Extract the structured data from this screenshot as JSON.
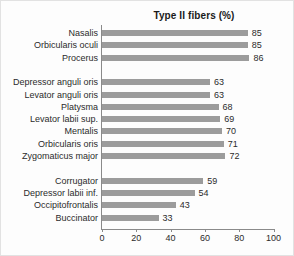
{
  "chart_data": {
    "type": "bar",
    "orientation": "horizontal",
    "title": "Type II fibers (%)",
    "xlabel": "",
    "ylabel": "",
    "xlim": [
      0,
      100
    ],
    "xticks": [
      0,
      20,
      40,
      60,
      80,
      100
    ],
    "grid": false,
    "legend": null,
    "bar_color": "#9c9c9c",
    "axis_color": "#8a8a8a",
    "text_color": "#2b2b2b",
    "categories": [
      "Nasalis",
      "Orbicularis oculi",
      "Procerus",
      "Depressor anguli oris",
      "Levator anguli oris",
      "Platysma",
      "Levator labii sup.",
      "Mentalis",
      "Orbicularis oris",
      "Zygomaticus major",
      "Corrugator",
      "Depressor labii inf.",
      "Occipitofrontalis",
      "Buccinator"
    ],
    "values": [
      85,
      85,
      86,
      63,
      63,
      68,
      69,
      70,
      71,
      72,
      59,
      54,
      43,
      33
    ],
    "groups": [
      {
        "name": "group-1",
        "categories": [
          "Nasalis",
          "Orbicularis oculi",
          "Procerus"
        ],
        "values": [
          85,
          85,
          86
        ]
      },
      {
        "name": "group-2",
        "categories": [
          "Depressor anguli oris",
          "Levator anguli oris",
          "Platysma",
          "Levator labii sup.",
          "Mentalis",
          "Orbicularis oris",
          "Zygomaticus major"
        ],
        "values": [
          63,
          63,
          68,
          69,
          70,
          71,
          72
        ]
      },
      {
        "name": "group-3",
        "categories": [
          "Corrugator",
          "Depressor labii inf.",
          "Occipitofrontalis",
          "Buccinator"
        ],
        "values": [
          59,
          54,
          43,
          33
        ]
      }
    ],
    "rows": [
      {
        "label": "Nasalis",
        "value": 85,
        "slot": 0
      },
      {
        "label": "Orbicularis oculi",
        "value": 85,
        "slot": 1
      },
      {
        "label": "Procerus",
        "value": 86,
        "slot": 2
      },
      {
        "label": "Depressor anguli oris",
        "value": 63,
        "slot": 4
      },
      {
        "label": "Levator anguli oris",
        "value": 63,
        "slot": 5
      },
      {
        "label": "Platysma",
        "value": 68,
        "slot": 6
      },
      {
        "label": "Levator labii sup.",
        "value": 69,
        "slot": 7
      },
      {
        "label": "Mentalis",
        "value": 70,
        "slot": 8
      },
      {
        "label": "Orbicularis oris",
        "value": 71,
        "slot": 9
      },
      {
        "label": "Zygomaticus major",
        "value": 72,
        "slot": 10
      },
      {
        "label": "Corrugator",
        "value": 59,
        "slot": 12
      },
      {
        "label": "Depressor labii inf.",
        "value": 54,
        "slot": 13
      },
      {
        "label": "Occipitofrontalis",
        "value": 43,
        "slot": 14
      },
      {
        "label": "Buccinator",
        "value": 33,
        "slot": 15
      }
    ]
  }
}
